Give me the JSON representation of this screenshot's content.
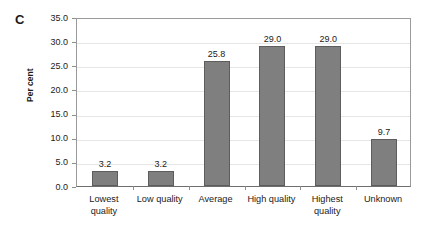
{
  "chart_data": {
    "type": "bar",
    "title": "",
    "panel_label": "C",
    "xlabel": "",
    "ylabel": "Per cent",
    "categories": [
      "Lowest quality",
      "Low quality",
      "Average",
      "High quality",
      "Highest quality",
      "Unknown"
    ],
    "values": [
      3.2,
      3.2,
      25.8,
      29.0,
      29.0,
      9.7
    ],
    "value_labels": [
      "3.2",
      "3.2",
      "25.8",
      "29.0",
      "29.0",
      "9.7"
    ],
    "ylim": [
      0,
      35
    ],
    "ytick_labels": [
      "35.0",
      "30.0",
      "25.0",
      "20.0",
      "15.0",
      "10.0",
      "5.0",
      "0.0"
    ],
    "ytick_values": [
      35,
      30,
      25,
      20,
      15,
      10,
      5,
      0
    ],
    "grid": "horizontal",
    "legend": "none",
    "bar_color": "#7f7f7f",
    "bar_border_color": "#5d5d5d",
    "gridline_color": "#e6e6e6",
    "axis_color": "#6e6e6e",
    "background_color": "#ffffff"
  }
}
